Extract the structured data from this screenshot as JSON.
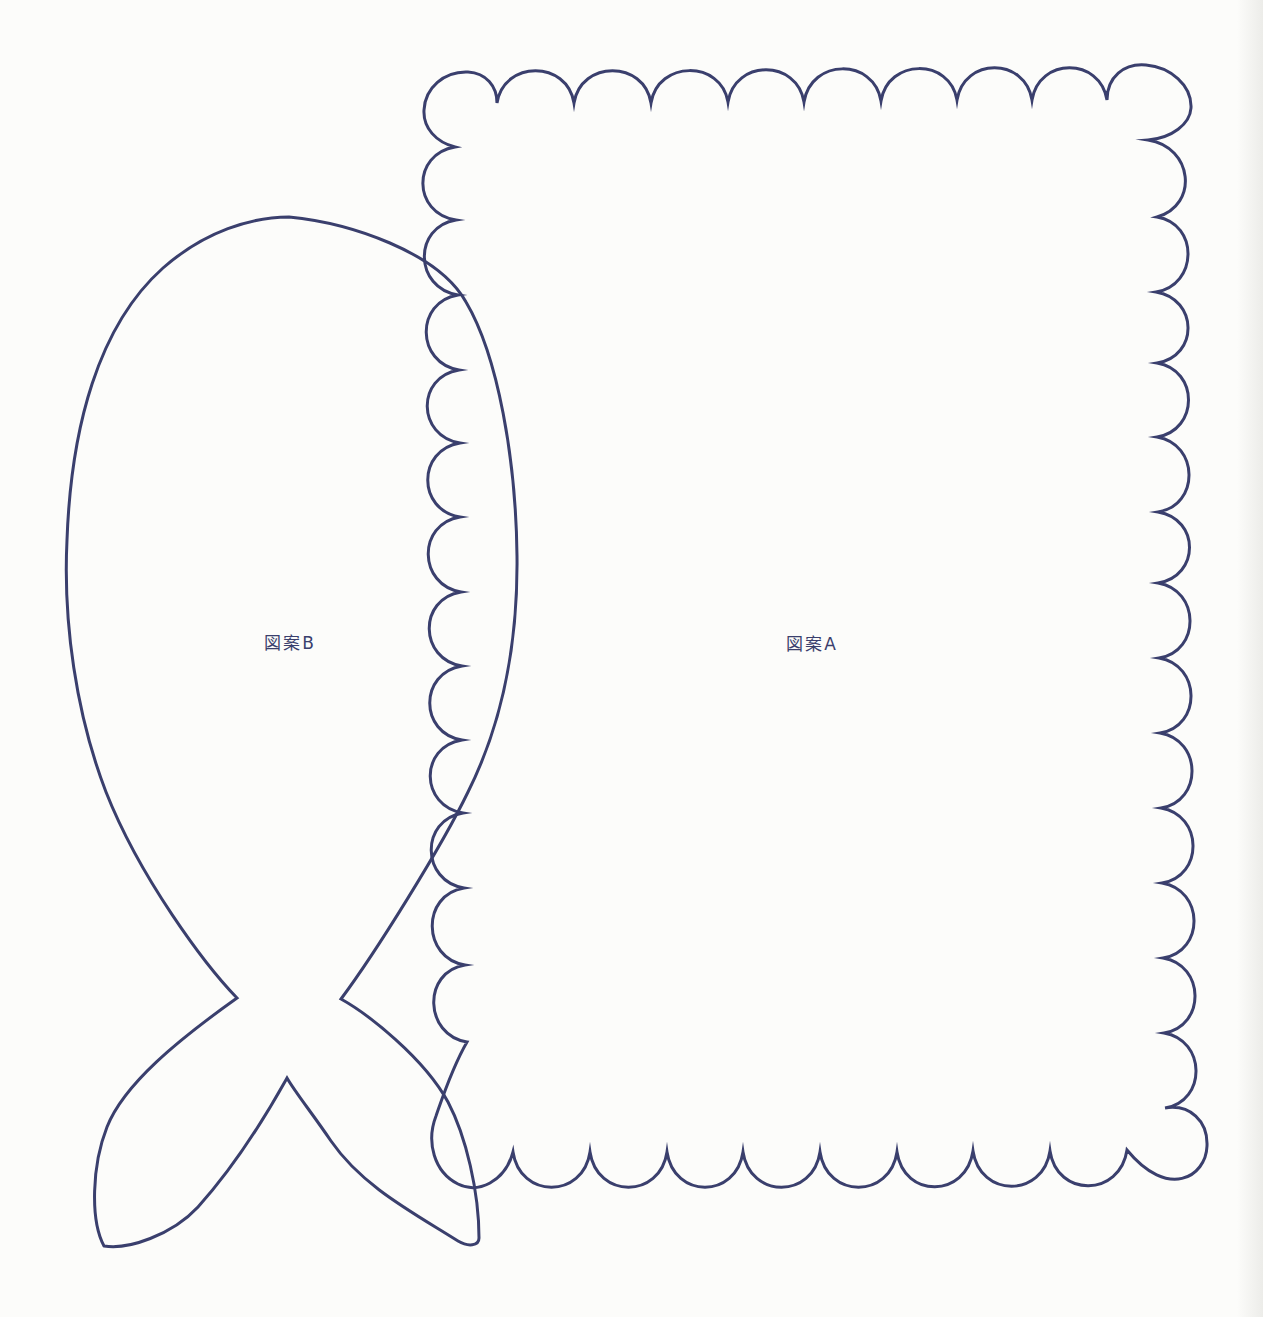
{
  "page": {
    "background_color": "#fcfcfa",
    "line_color": "#3a3f6d"
  },
  "patterns": {
    "pattern_a": {
      "label": "図案A"
    },
    "pattern_b": {
      "label": "図案B"
    }
  }
}
